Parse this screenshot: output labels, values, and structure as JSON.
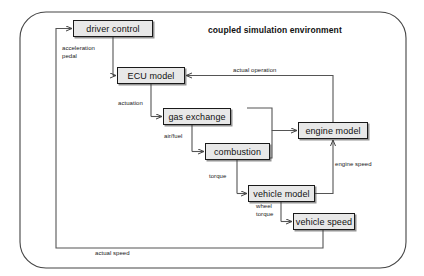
{
  "diagram": {
    "title": "coupled simulation environment",
    "title_pos": {
      "x": 208,
      "y": 25
    },
    "frame": {
      "x": 20,
      "y": 12,
      "w": 386,
      "h": 256,
      "radius": 26
    },
    "nodes": [
      {
        "id": "driver_control",
        "label": "driver control",
        "x": 73,
        "y": 20,
        "w": 80,
        "h": 17
      },
      {
        "id": "ecu_model",
        "label": "ECU model",
        "x": 117,
        "y": 67,
        "w": 68,
        "h": 17
      },
      {
        "id": "gas_exchange",
        "label": "gas exchange",
        "x": 163,
        "y": 108,
        "w": 68,
        "h": 17
      },
      {
        "id": "combustion",
        "label": "combustion",
        "x": 205,
        "y": 143,
        "w": 65,
        "h": 17
      },
      {
        "id": "engine_model",
        "label": "engine model",
        "x": 298,
        "y": 122,
        "w": 70,
        "h": 17
      },
      {
        "id": "vehicle_model",
        "label": "vehicle model",
        "x": 248,
        "y": 185,
        "w": 67,
        "h": 17
      },
      {
        "id": "vehicle_speed",
        "label": "vehicle speed",
        "x": 293,
        "y": 213,
        "w": 62,
        "h": 17
      }
    ],
    "edge_labels": [
      {
        "id": "acceleration_pedal",
        "text": "acceleration\npedal",
        "x": 62,
        "y": 45
      },
      {
        "id": "actuation",
        "text": "actuation",
        "x": 118,
        "y": 100
      },
      {
        "id": "actual_operation",
        "text": "actual operation",
        "x": 233,
        "y": 67
      },
      {
        "id": "air_fuel",
        "text": "air/fuel",
        "x": 164,
        "y": 133
      },
      {
        "id": "torque",
        "text": "torque",
        "x": 209,
        "y": 173
      },
      {
        "id": "engine_speed",
        "text": "engine speed",
        "x": 335,
        "y": 161
      },
      {
        "id": "wheel_torque",
        "text": "wheel\ntorque",
        "x": 256,
        "y": 203
      },
      {
        "id": "actual_speed",
        "text": "actual speed",
        "x": 95,
        "y": 250
      }
    ],
    "colors": {
      "node_fill": "#e8e8e8",
      "node_stroke": "#1a1a1a",
      "edge_stroke": "#555555",
      "frame_stroke": "#444444",
      "text": "#111111"
    }
  }
}
